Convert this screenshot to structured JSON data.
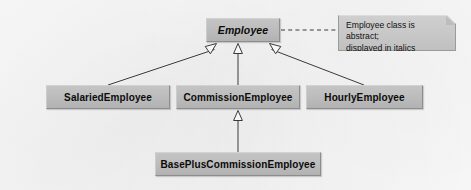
{
  "diagram": {
    "type": "uml-class-inheritance-hierarchy",
    "background_color": "#fafafa",
    "box_fill_color": "#bdbdbd",
    "box_border_color": "#8d8d8d",
    "note_fill_color": "#c8c8c8",
    "line_color": "#3a3a3a",
    "classes": [
      {
        "id": "employee",
        "name": "Employee",
        "abstract": true,
        "level": 0
      },
      {
        "id": "salaried",
        "name": "SalariedEmployee",
        "abstract": false,
        "level": 1
      },
      {
        "id": "commission",
        "name": "CommissionEmployee",
        "abstract": false,
        "level": 1
      },
      {
        "id": "hourly",
        "name": "HourlyEmployee",
        "abstract": false,
        "level": 1
      },
      {
        "id": "baseplus",
        "name": "BasePlusCommissionEmployee",
        "abstract": false,
        "level": 2
      }
    ],
    "generalizations": [
      {
        "from": "salaried",
        "to": "employee",
        "arrow": "hollow-triangle",
        "style": "solid"
      },
      {
        "from": "commission",
        "to": "employee",
        "arrow": "hollow-triangle",
        "style": "solid"
      },
      {
        "from": "hourly",
        "to": "employee",
        "arrow": "hollow-triangle",
        "style": "solid"
      },
      {
        "from": "baseplus",
        "to": "commission",
        "arrow": "hollow-triangle",
        "style": "solid"
      }
    ],
    "note": {
      "id": "note-abstract",
      "attached_to": "employee",
      "connector_style": "dashed",
      "lines": [
        "Employee class is abstract;",
        "displayed in italics"
      ]
    }
  }
}
